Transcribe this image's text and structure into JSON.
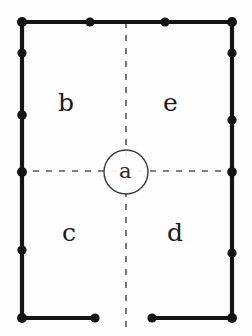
{
  "figure": {
    "type": "archaeological-plan",
    "canvas": {
      "width": 252,
      "height": 336
    },
    "background_color": "#fefefe",
    "ink_color": "#141414"
  },
  "labels": {
    "center": "a",
    "upper_left": "b",
    "upper_right": "e",
    "lower_left": "c",
    "lower_right": "d"
  },
  "structure": {
    "wall_color": "#141414",
    "wall_thickness_px": 4,
    "outline": {
      "left_x": 22,
      "right_x": 232,
      "top_y": 22,
      "bottom_y": 318
    },
    "entrance_gap": {
      "edge": "bottom",
      "start_x": 95,
      "end_x": 152
    },
    "post_dots": {
      "radius_px": 4.5,
      "color": "#141414",
      "top_edge": [
        {
          "x": 22,
          "y": 22
        },
        {
          "x": 90,
          "y": 22
        },
        {
          "x": 165,
          "y": 22
        },
        {
          "x": 232,
          "y": 22
        }
      ],
      "left_edge": [
        {
          "x": 22,
          "y": 22
        },
        {
          "x": 22,
          "y": 53
        },
        {
          "x": 22,
          "y": 115
        },
        {
          "x": 22,
          "y": 172
        },
        {
          "x": 22,
          "y": 250
        },
        {
          "x": 22,
          "y": 318
        }
      ],
      "right_edge": [
        {
          "x": 232,
          "y": 22
        },
        {
          "x": 232,
          "y": 53
        },
        {
          "x": 232,
          "y": 120
        },
        {
          "x": 232,
          "y": 172
        },
        {
          "x": 232,
          "y": 253
        },
        {
          "x": 232,
          "y": 318
        }
      ],
      "bottom_edge": [
        {
          "x": 22,
          "y": 318
        },
        {
          "x": 95,
          "y": 318
        },
        {
          "x": 152,
          "y": 318
        },
        {
          "x": 232,
          "y": 318
        }
      ]
    }
  },
  "axes": {
    "style": "dashed",
    "color": "#565656",
    "dash_pattern": "6 7",
    "vertical": {
      "x": 126,
      "y_start": 22,
      "y_end": 332
    },
    "horizontal": {
      "y": 171,
      "x_start": 20,
      "x_end": 234
    }
  },
  "central_feature": {
    "name": "hearth-circle",
    "cx": 126,
    "cy": 172,
    "r": 22,
    "stroke_color": "#3a3a3a",
    "stroke_width": 1.4,
    "fill": "none"
  }
}
